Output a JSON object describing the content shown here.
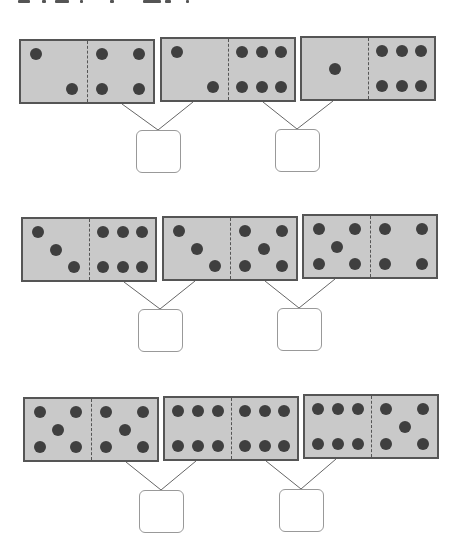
{
  "instruction_text_cropped": "",
  "colors": {
    "domino_fill": "#c9c9c9",
    "domino_border": "#555555",
    "pip": "#3f3f3f",
    "connector_line": "#666666",
    "answer_box_border": "#999999"
  },
  "rows": [
    {
      "dominoes": [
        {
          "left": 2,
          "right": 4
        },
        {
          "left": 2,
          "right": 6
        },
        {
          "left": 1,
          "right": 6
        }
      ],
      "answer_boxes": [
        "",
        ""
      ]
    },
    {
      "dominoes": [
        {
          "left": 3,
          "right": 6
        },
        {
          "left": 3,
          "right": 5
        },
        {
          "left": 5,
          "right": 4
        }
      ],
      "answer_boxes": [
        "",
        ""
      ]
    },
    {
      "dominoes": [
        {
          "left": 5,
          "right": 5
        },
        {
          "left": 6,
          "right": 6
        },
        {
          "left": 6,
          "right": 5
        }
      ],
      "answer_boxes": [
        "",
        ""
      ]
    }
  ]
}
